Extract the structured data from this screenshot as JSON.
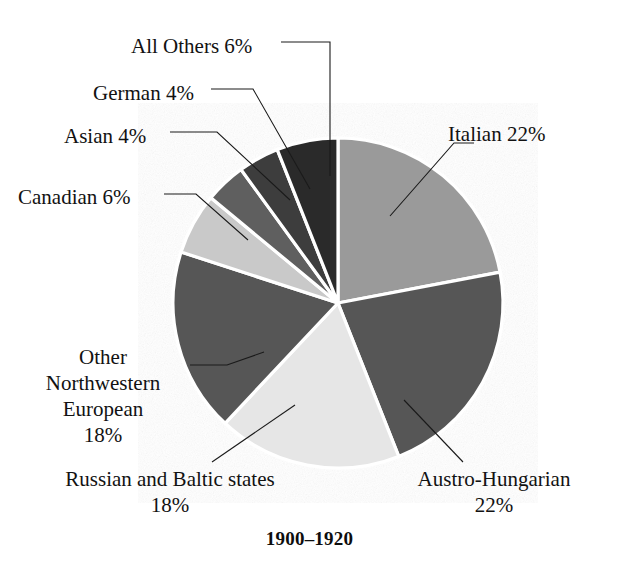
{
  "chart_data": {
    "type": "pie",
    "title": "1900–1920",
    "xlabel": "",
    "ylabel": "",
    "legend_position": "callout-labels",
    "grid": false,
    "start_angle_deg": 0,
    "direction": "clockwise",
    "units": "percent",
    "categories": [
      "Italian",
      "Austro-Hungarian",
      "Russian and Baltic states",
      "Other Northwestern European",
      "Canadian",
      "Asian",
      "German",
      "All Others"
    ],
    "values": [
      22,
      22,
      18,
      18,
      6,
      4,
      4,
      6
    ],
    "colors": [
      "#9a9a9a",
      "#575757",
      "#e6e6e6",
      "#565656",
      "#c9c9c9",
      "#5e5e5e",
      "#3c3c3c",
      "#2b2b2b"
    ],
    "slice_separator_color": "#ffffff",
    "labels": [
      "Italian 22%",
      "Austro-Hungarian\n22%",
      "Russian and Baltic states\n18%",
      "Other Northwestern European\n18%",
      "Canadian 6%",
      "Asian 4%",
      "German 4%",
      "All Others 6%"
    ]
  },
  "geometry": {
    "center_x": 338,
    "center_y": 303,
    "radius": 165
  },
  "labels": {
    "all_others": "All Others 6%",
    "german": "German 4%",
    "asian": "Asian 4%",
    "canadian": "Canadian 6%",
    "other_northwestern": "Other Northwestern European 18%",
    "other_nw_line1": "Other",
    "other_nw_line2": "Northwestern",
    "other_nw_line3": "European",
    "other_nw_line4": "18%",
    "russian_line1": "Russian and Baltic states",
    "russian_line2": "18%",
    "austro_line1": "Austro-Hungarian",
    "austro_line2": "22%",
    "italian": "Italian 22%"
  },
  "title": "1900–1920"
}
